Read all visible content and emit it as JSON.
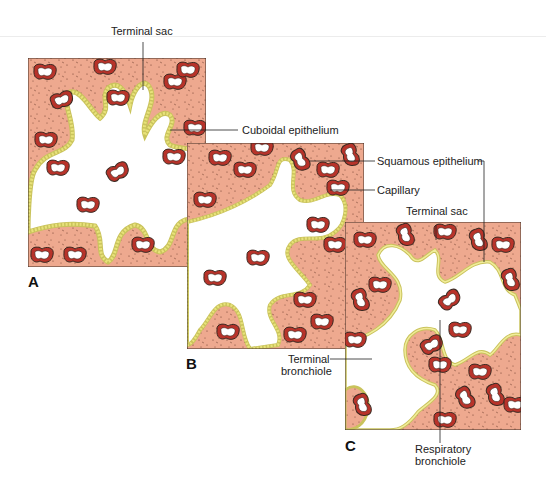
{
  "figure": {
    "panels": [
      {
        "id": "A",
        "letter": "A",
        "stage": "terminal sac period, cuboidal lining"
      },
      {
        "id": "B",
        "letter": "B",
        "stage": "thinning epithelium with capillaries"
      },
      {
        "id": "C",
        "letter": "C",
        "stage": "squamous lining with respiratory bronchiole"
      }
    ],
    "labels": {
      "terminal_sac_a": "Terminal sac",
      "cuboidal_epithelium": "Cuboidal epithelium",
      "squamous_epithelium": "Squamous epithelium",
      "capillary": "Capillary",
      "terminal_sac_c": "Terminal sac",
      "terminal_bronchiole_1": "Terminal",
      "terminal_bronchiole_2": "bronchiole",
      "respiratory_bronchiole_1": "Respiratory",
      "respiratory_bronchiole_2": "bronchiole"
    },
    "colors": {
      "tissue": "#eea98f",
      "capillary_wall": "#b8332a",
      "epithelium": "#e8e27a",
      "outline": "#3a2a22",
      "lumen": "#ffffff"
    }
  }
}
